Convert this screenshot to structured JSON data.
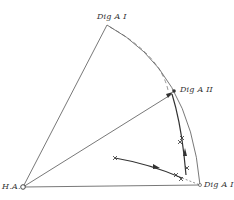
{
  "labels": {
    "origin": "H.A.",
    "top": "Dig A I",
    "middle": "Dig A II",
    "right": "Dig A I"
  },
  "colors": {
    "line": "#555555",
    "background": "#ffffff"
  },
  "points": {
    "origin": [
      23,
      187
    ],
    "top": [
      107,
      25
    ],
    "middle": [
      173,
      92
    ],
    "right": [
      200,
      185
    ]
  },
  "track_markers": [
    [
      115,
      158
    ],
    [
      176,
      175
    ],
    [
      181,
      179
    ],
    [
      187,
      168
    ],
    [
      180,
      142
    ],
    [
      182,
      138
    ]
  ]
}
